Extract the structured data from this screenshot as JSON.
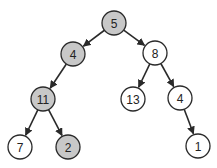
{
  "diagram": {
    "type": "binary-tree",
    "colors": {
      "highlight_fill": "#c8c8c8",
      "default_fill": "#ffffff",
      "stroke": "#2a2a2a"
    },
    "node_radius": 12,
    "nodes": [
      {
        "id": "n5",
        "label": "5",
        "x": 114,
        "y": 23,
        "highlighted": true
      },
      {
        "id": "n4a",
        "label": "4",
        "x": 73,
        "y": 54,
        "highlighted": true
      },
      {
        "id": "n8",
        "label": "8",
        "x": 155,
        "y": 53,
        "highlighted": false
      },
      {
        "id": "n11",
        "label": "11",
        "x": 43,
        "y": 99,
        "highlighted": true
      },
      {
        "id": "n13",
        "label": "13",
        "x": 133,
        "y": 99,
        "highlighted": false
      },
      {
        "id": "n4b",
        "label": "4",
        "x": 180,
        "y": 98,
        "highlighted": false
      },
      {
        "id": "n7",
        "label": "7",
        "x": 20,
        "y": 147,
        "highlighted": false
      },
      {
        "id": "n2",
        "label": "2",
        "x": 68,
        "y": 147,
        "highlighted": true
      },
      {
        "id": "n1",
        "label": "1",
        "x": 198,
        "y": 146,
        "highlighted": false
      }
    ],
    "edges": [
      {
        "from": "n5",
        "to": "n4a"
      },
      {
        "from": "n5",
        "to": "n8"
      },
      {
        "from": "n4a",
        "to": "n11"
      },
      {
        "from": "n8",
        "to": "n13"
      },
      {
        "from": "n8",
        "to": "n4b"
      },
      {
        "from": "n11",
        "to": "n7"
      },
      {
        "from": "n11",
        "to": "n2"
      },
      {
        "from": "n4b",
        "to": "n1"
      }
    ]
  }
}
